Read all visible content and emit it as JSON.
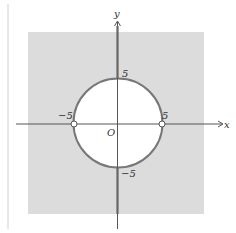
{
  "figure": {
    "axes": {
      "x_label": "x",
      "y_label": "y",
      "origin_label": "O"
    },
    "ticks": {
      "x_pos": "5",
      "x_neg": "−5",
      "y_pos": "5",
      "y_neg": "−5"
    },
    "circle": {
      "center": [
        0,
        0
      ],
      "radius": 5
    },
    "open_points": [
      [
        -5,
        0
      ],
      [
        5,
        0
      ]
    ],
    "colors": {
      "shade": "#dcdcdc",
      "circle_fill": "#ffffff",
      "circle_stroke": "#777777",
      "axis": "#444444",
      "thick_axis": "#666666"
    }
  }
}
